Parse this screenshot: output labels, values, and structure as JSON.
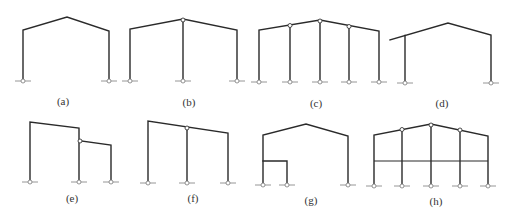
{
  "figure": {
    "line_color": "#2a2a2a",
    "background": "#ffffff",
    "panels": [
      {
        "id": "a",
        "label": "(a)",
        "type": "single-span gabled portal frame",
        "label_pos": [
          63,
          102
        ]
      },
      {
        "id": "b",
        "label": "(b)",
        "type": "two-span gabled frame with hinged center column",
        "label_pos": [
          189,
          103
        ]
      },
      {
        "id": "c",
        "label": "(c)",
        "type": "four-span gabled frame with three hinged interior columns",
        "label_pos": [
          316,
          104
        ]
      },
      {
        "id": "d",
        "label": "(d)",
        "type": "single-span gabled frame with cantilever eave",
        "label_pos": [
          442,
          104
        ]
      },
      {
        "id": "e",
        "label": "(e)",
        "type": "high-low span frame with hinged lean-to",
        "label_pos": [
          72,
          199
        ]
      },
      {
        "id": "f",
        "label": "(f)",
        "type": "two-span mono-pitch frame with hinged center column",
        "label_pos": [
          193,
          199
        ]
      },
      {
        "id": "g",
        "label": "(g)",
        "type": "gabled frame with internal mezzanine bay",
        "label_pos": [
          311,
          201
        ]
      },
      {
        "id": "h",
        "label": "(h)",
        "type": "four-span gabled frame with intermediate floor beam",
        "label_pos": [
          436,
          202
        ]
      }
    ]
  }
}
